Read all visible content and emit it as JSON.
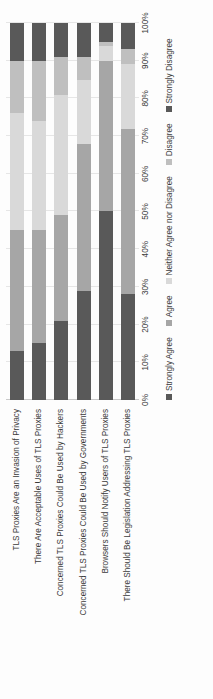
{
  "chart_data": {
    "type": "bar",
    "orientation": "horizontal",
    "stacked": true,
    "stack_mode": "percent",
    "title": "",
    "xlabel": "",
    "ylabel": "",
    "xlim": [
      0,
      100
    ],
    "grid": true,
    "legend_position": "bottom",
    "tick_labels": [
      "0%",
      "10%",
      "20%",
      "30%",
      "40%",
      "50%",
      "60%",
      "70%",
      "80%",
      "90%",
      "100%"
    ],
    "tick_values": [
      0,
      10,
      20,
      30,
      40,
      50,
      60,
      70,
      80,
      90,
      100
    ],
    "categories": [
      "TLS Proxies Are an Invasion of Privacy",
      "There Are Acceptable Uses of TLS Proxies",
      "Concerned TLS Proxies Could Be Used by Hackers",
      "Concerned TLS Proxies Could Be Used by Governments",
      "Browsers Should Notify Users of TLS Proxies",
      "There Should Be Legislation Addressing TLS Proxies"
    ],
    "series": [
      {
        "name": "Strongly Agree",
        "color": "#595959",
        "values": [
          13,
          15,
          21,
          29,
          50,
          28
        ]
      },
      {
        "name": "Agree",
        "color": "#a6a6a6",
        "values": [
          32,
          30,
          28,
          39,
          40,
          44
        ]
      },
      {
        "name": "Neither Agree nor Disagree",
        "color": "#d9d9d9",
        "values": [
          31,
          29,
          32,
          17,
          4,
          17
        ]
      },
      {
        "name": "Disagree",
        "color": "#bfbfbf",
        "values": [
          14,
          16,
          10,
          6,
          1,
          4
        ]
      },
      {
        "name": "Strongly Disagree",
        "color": "#595959",
        "values": [
          10,
          10,
          9,
          9,
          5,
          7
        ]
      }
    ]
  },
  "legend": {
    "items": [
      {
        "label": "Strongly Agree",
        "color": "#595959"
      },
      {
        "label": "Agree",
        "color": "#a6a6a6"
      },
      {
        "label": "Neither Agree nor Disagree",
        "color": "#d9d9d9"
      },
      {
        "label": "Disagree",
        "color": "#bfbfbf"
      },
      {
        "label": "Strongly Disagree",
        "color": "#595959"
      }
    ]
  }
}
